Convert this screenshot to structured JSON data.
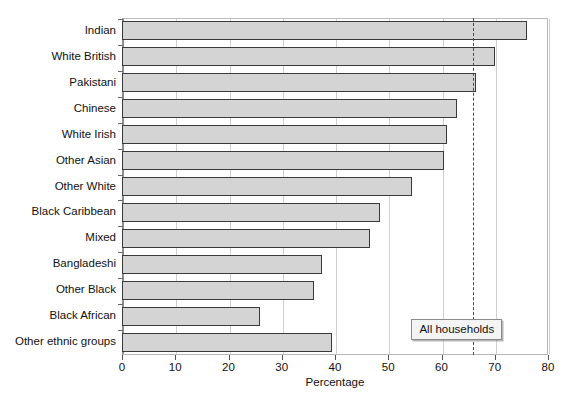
{
  "chart_data": {
    "type": "bar",
    "orientation": "horizontal",
    "title": "",
    "xlabel": "Percentage",
    "ylabel": "",
    "xlim": [
      0,
      80
    ],
    "xticks": [
      0,
      10,
      20,
      30,
      40,
      50,
      60,
      70,
      80
    ],
    "grid": true,
    "legend": null,
    "categories": [
      "Indian",
      "White British",
      "Pakistani",
      "Chinese",
      "White Irish",
      "Other Asian",
      "Other White",
      "Black Caribbean",
      "Mixed",
      "Bangladeshi",
      "Other Black",
      "Black African",
      "Other ethnic groups"
    ],
    "values": [
      76,
      70,
      66.5,
      63,
      61,
      60.5,
      54.5,
      48.5,
      46.5,
      37.5,
      36,
      26,
      39.5
    ],
    "annotations": [
      {
        "label": "All households",
        "value": 66,
        "type": "reference-line",
        "style": "dashed"
      }
    ],
    "colors": {
      "bar_fill": "#d4d4d4",
      "bar_stroke": "#3a3a3a",
      "gridline": "#cfcfcf",
      "axis": "#8d8d8d",
      "reference_line": "#4a4a4a",
      "annotation_bg": "#f4f4f4"
    }
  }
}
